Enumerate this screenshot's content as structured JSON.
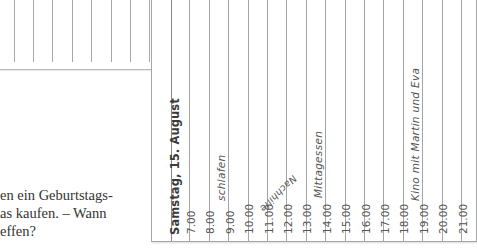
{
  "left_page": {
    "body_lines": [
      "en ein Geburtstags-",
      "as kaufen. – Wann",
      "effen?"
    ]
  },
  "calendar_card": {
    "day_heading": "Samstag, 15. August",
    "hours": [
      "7.00",
      "8.00",
      "9.00",
      "10.00",
      "11.00",
      "12.00",
      "13.00",
      "14.00",
      "15.00",
      "16.00",
      "17.00",
      "18.00",
      "19.00",
      "20.00",
      "21.00"
    ],
    "entries": {
      "schlafen": "schlafen",
      "nachhilfe": "Nachhilfe",
      "mittagessen": "Mittagessen",
      "kino": "Kino mit Martin und Eva"
    }
  },
  "colors": {
    "rule": "#a4a4a4",
    "text": "#555555",
    "heading": "#3a3a3a"
  }
}
